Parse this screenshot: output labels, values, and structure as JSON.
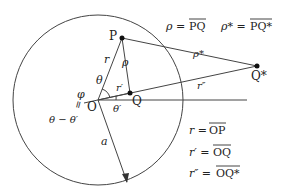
{
  "points": {
    "P": {
      "label": "P",
      "x": 122,
      "y": 38
    },
    "Q": {
      "label": "Q",
      "x": 130,
      "y": 93
    },
    "Qstar": {
      "label": "Q*",
      "x": 257,
      "y": 66
    },
    "O": {
      "label": "O",
      "x": 98,
      "y": 100
    }
  },
  "circle": {
    "cx": 98,
    "cy": 100,
    "r": 85
  },
  "labels": {
    "r": "r",
    "rho": "ρ",
    "rho_star": "ρ*",
    "r_prime": "r′",
    "r_dprime": "r″",
    "theta": "θ",
    "theta_prime": "θ′",
    "phi": "φ",
    "eq": "=",
    "theta_minus": "θ − θ′",
    "a": "a"
  },
  "definitions": {
    "rho_lhs": "ρ = ",
    "rho_rhs": "PQ",
    "rho_star_lhs": "ρ* = ",
    "rho_star_rhs": "PQ*",
    "r_lhs": "r = ",
    "r_rhs": "OP",
    "r_prime_lhs": "r′ = ",
    "r_prime_rhs": "OQ",
    "r_dprime_lhs": "r″ = ",
    "r_dprime_rhs": "OQ*"
  }
}
